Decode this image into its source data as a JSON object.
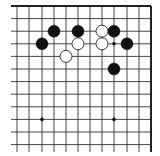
{
  "board": {
    "title": "Go board diagram (partial, top-right region)",
    "background": "#ffffff",
    "line_color": "#333333",
    "edge_color": "#222222",
    "columns_x": [
      17,
      29,
      42,
      54,
      66,
      78,
      90,
      102,
      114,
      127,
      139,
      151
    ],
    "rows_y": [
      6,
      18.6,
      31.2,
      43.8,
      56.4,
      69,
      81.6,
      94.2,
      106.8,
      119.4,
      132,
      144.6
    ],
    "line_start_x": 11,
    "line_end_y": 152,
    "top_edge": true,
    "right_edge": true,
    "stone_radius": 6,
    "star_points": [
      {
        "col": 8,
        "row": 3
      },
      {
        "col": 2,
        "row": 9
      },
      {
        "col": 8,
        "row": 9
      }
    ],
    "stones": [
      {
        "color": "black",
        "col": 3,
        "row": 2
      },
      {
        "color": "black",
        "col": 5,
        "row": 2
      },
      {
        "color": "white",
        "col": 7,
        "row": 2
      },
      {
        "color": "black",
        "col": 8,
        "row": 2
      },
      {
        "color": "black",
        "col": 2,
        "row": 3
      },
      {
        "color": "white",
        "col": 5,
        "row": 3
      },
      {
        "color": "white",
        "col": 7,
        "row": 3
      },
      {
        "color": "black",
        "col": 9,
        "row": 3
      },
      {
        "color": "white",
        "col": 4,
        "row": 4
      },
      {
        "color": "black",
        "col": 8,
        "row": 5
      }
    ],
    "colors": {
      "black_stone": "#111111",
      "white_stone_fill": "#ffffff",
      "white_stone_stroke": "#222222"
    }
  }
}
